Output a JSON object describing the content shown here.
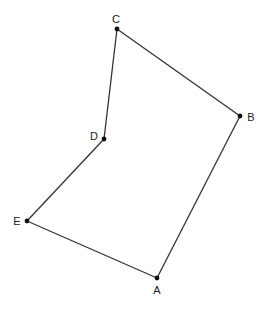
{
  "diagram": {
    "type": "polygon",
    "closed": true,
    "colors": {
      "edge": "#333333",
      "vertex": "#111111",
      "label": "#222222",
      "background": "#ffffff"
    },
    "points": [
      {
        "name": "A",
        "x": 157,
        "y": 278,
        "label_x": 157,
        "label_y": 290
      },
      {
        "name": "B",
        "x": 240,
        "y": 116,
        "label_x": 251,
        "label_y": 117
      },
      {
        "name": "C",
        "x": 117,
        "y": 29,
        "label_x": 116,
        "label_y": 19
      },
      {
        "name": "D",
        "x": 104,
        "y": 139,
        "label_x": 94,
        "label_y": 136
      },
      {
        "name": "E",
        "x": 27,
        "y": 221,
        "label_x": 17,
        "label_y": 221
      }
    ],
    "edges": [
      [
        "A",
        "B"
      ],
      [
        "B",
        "C"
      ],
      [
        "C",
        "D"
      ],
      [
        "D",
        "E"
      ],
      [
        "E",
        "A"
      ]
    ]
  }
}
